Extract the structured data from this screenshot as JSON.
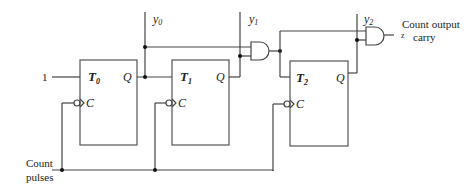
{
  "diagram": {
    "input_constant": "1",
    "flip_flops": [
      {
        "name": "T",
        "sub": "0",
        "q_label": "Q",
        "clock_label": "C",
        "output": "y",
        "output_sub": "0"
      },
      {
        "name": "T",
        "sub": "1",
        "q_label": "Q",
        "clock_label": "C",
        "output": "y",
        "output_sub": "1"
      },
      {
        "name": "T",
        "sub": "2",
        "q_label": "Q",
        "clock_label": "C",
        "output": "y",
        "output_sub": "2"
      }
    ],
    "gates": [
      {
        "type": "AND",
        "inputs": [
          "y0",
          "y1"
        ],
        "output": "T2"
      },
      {
        "type": "AND",
        "inputs": [
          "y0·y1",
          "y2"
        ],
        "output": "z"
      }
    ],
    "output_label_z": "z",
    "output_text_line1": "Count output",
    "output_text_line2": "carry",
    "input_text_line1": "Count",
    "input_text_line2": "pulses"
  }
}
